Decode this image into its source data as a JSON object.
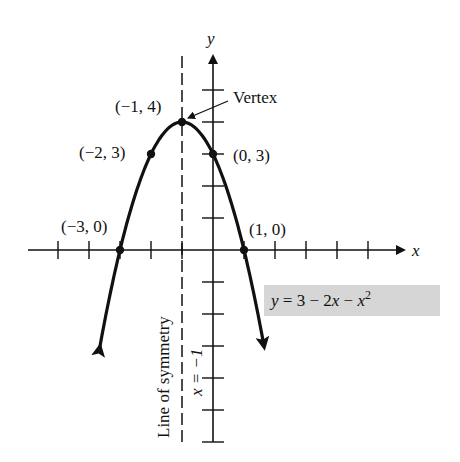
{
  "chart_data": {
    "type": "line",
    "title": "",
    "equation": "y = 3 − 2x − x²",
    "function": {
      "a": -1,
      "b": -2,
      "c": 3
    },
    "xlabel": "x",
    "ylabel": "y",
    "xlim": [
      -6,
      6
    ],
    "ylim": [
      -6,
      5
    ],
    "x_ticks": [
      -5,
      -4,
      -3,
      -2,
      -1,
      1,
      2,
      3,
      4,
      5
    ],
    "y_ticks": [
      -6,
      -5,
      -4,
      -3,
      -2,
      -1,
      1,
      2,
      3,
      4,
      5
    ],
    "grid": false,
    "curve_x_range": [
      -3.65,
      1.65
    ],
    "points": [
      {
        "x": -3,
        "y": 0,
        "label": "(−3, 0)"
      },
      {
        "x": -2,
        "y": 3,
        "label": "(−2, 3)"
      },
      {
        "x": -1,
        "y": 4,
        "label": "(−1, 4)"
      },
      {
        "x": 0,
        "y": 3,
        "label": "(0, 3)"
      },
      {
        "x": 1,
        "y": 0,
        "label": "(1, 0)"
      }
    ],
    "vertex": {
      "x": -1,
      "y": 4,
      "annotation": "Vertex"
    },
    "axis_of_symmetry": {
      "x": -1,
      "label": "Line of symmetry",
      "equation": "x = −1"
    }
  },
  "labels": {
    "x_axis": "x",
    "y_axis": "y",
    "vertex": "Vertex",
    "p_m3_0": "(−3, 0)",
    "p_m2_3": "(−2, 3)",
    "p_m1_4": "(−1, 4)",
    "p_0_3": "(0, 3)",
    "p_1_0": "(1, 0)",
    "symmetry": "Line of symmetry",
    "symmetry_eq": "x = −1",
    "eq_y": "y",
    "eq_mid": " = 3 − 2",
    "eq_x1": "x",
    "eq_minus": " − ",
    "eq_x2": "x",
    "eq_exp": "2"
  },
  "colors": {
    "ink": "#111111",
    "eq_box": "#d6d6d6"
  }
}
